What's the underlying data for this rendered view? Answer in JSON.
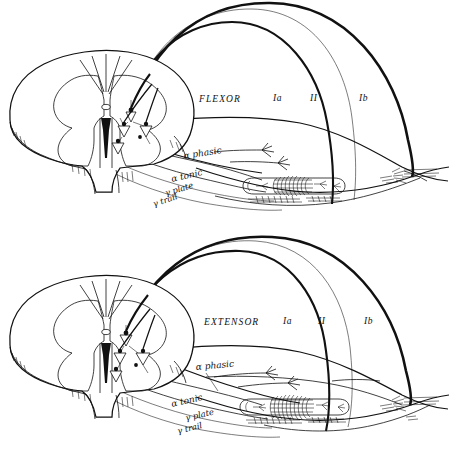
{
  "figure": {
    "background_color": "#ffffff",
    "ink_color": "#111111"
  },
  "panels": [
    {
      "id": "flexor",
      "muscle_label": "FLEXOR",
      "afferents": [
        {
          "id": "Ia",
          "label": "Ia",
          "description": "primary spindle afferent"
        },
        {
          "id": "II",
          "label": "II",
          "description": "secondary spindle afferent"
        },
        {
          "id": "Ib",
          "label": "Ib",
          "description": "Golgi tendon organ afferent"
        }
      ],
      "efferents": [
        {
          "id": "alpha-phasic",
          "label": "α phasic"
        },
        {
          "id": "alpha-tonic",
          "label": "α tonic"
        },
        {
          "id": "gamma-plate",
          "label": "γ plate"
        },
        {
          "id": "gamma-trail",
          "label": "γ trail"
        }
      ],
      "structures": [
        "spinal-cord-cross-section",
        "dorsal-horn",
        "ventral-horn",
        "central-canal",
        "muscle-belly",
        "muscle-spindle",
        "golgi-tendon-organ",
        "tendon"
      ]
    },
    {
      "id": "extensor",
      "muscle_label": "EXTENSOR",
      "afferents": [
        {
          "id": "Ia",
          "label": "Ia",
          "description": "primary spindle afferent"
        },
        {
          "id": "II",
          "label": "II",
          "description": "secondary spindle afferent"
        },
        {
          "id": "Ib",
          "label": "Ib",
          "description": "Golgi tendon organ afferent"
        }
      ],
      "efferents": [
        {
          "id": "alpha-phasic",
          "label": "α phasic"
        },
        {
          "id": "alpha-tonic",
          "label": "α tonic"
        },
        {
          "id": "gamma-plate",
          "label": "γ plate"
        },
        {
          "id": "gamma-trail",
          "label": "γ trail"
        }
      ],
      "structures": [
        "spinal-cord-cross-section",
        "dorsal-horn",
        "ventral-horn",
        "central-canal",
        "muscle-belly",
        "muscle-spindle",
        "golgi-tendon-organ",
        "tendon"
      ]
    }
  ]
}
